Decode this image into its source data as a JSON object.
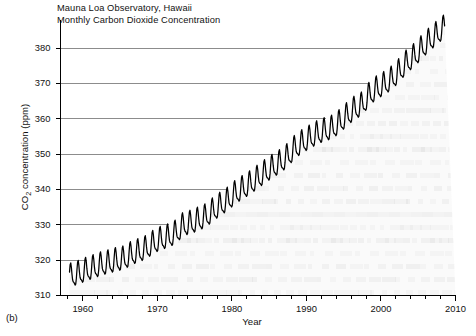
{
  "figure": {
    "panel_letter": "(b)",
    "title_line1": "Mauna Loa Observatory, Hawaii",
    "title_line2": "Monthly Carbon Dioxide Concentration",
    "xlabel": "Year",
    "ylabel_prefix": "CO",
    "ylabel_sub": "2",
    "ylabel_suffix": " concentration (ppm)"
  },
  "chart_data": {
    "type": "line",
    "title": "Mauna Loa Observatory, Hawaii Monthly Carbon Dioxide Concentration",
    "xlabel": "Year",
    "ylabel": "CO2 concentration (ppm)",
    "xlim": [
      1957,
      2010
    ],
    "ylim": [
      310,
      388
    ],
    "xticks": [
      1960,
      1970,
      1980,
      1990,
      2000,
      2010
    ],
    "xtick_labels": [
      "1960",
      "1970",
      "1980",
      "1990",
      "2000",
      "2010"
    ],
    "yticks": [
      310,
      320,
      330,
      340,
      350,
      360,
      370,
      380
    ],
    "ytick_labels": [
      "310",
      "320",
      "330",
      "340",
      "350",
      "360",
      "370",
      "380"
    ],
    "minor_xtick_interval": 2,
    "grid": "horizontal-gridlines-clipped-at-curve",
    "legend": "none",
    "line_color": "#000000",
    "gridline_color": "#808080",
    "seasonal_amplitude_ppm": 3.1,
    "seasonal_peak_month": 5,
    "seasonal_trough_month": 10,
    "series": [
      {
        "name": "Monthly mean CO2",
        "x_units": "year",
        "y_units": "ppm",
        "annual_means": {
          "1958": 315.3,
          "1959": 315.98,
          "1960": 316.91,
          "1961": 317.64,
          "1962": 318.45,
          "1963": 318.99,
          "1964": 319.62,
          "1965": 320.04,
          "1966": 321.38,
          "1967": 322.16,
          "1968": 323.04,
          "1969": 324.62,
          "1970": 325.68,
          "1971": 326.32,
          "1972": 327.45,
          "1973": 329.68,
          "1974": 330.18,
          "1975": 331.11,
          "1976": 332.04,
          "1977": 333.83,
          "1978": 335.4,
          "1979": 336.84,
          "1980": 338.75,
          "1981": 340.11,
          "1982": 341.45,
          "1983": 343.05,
          "1984": 344.65,
          "1985": 346.12,
          "1986": 347.42,
          "1987": 349.19,
          "1988": 351.57,
          "1989": 353.12,
          "1990": 354.39,
          "1991": 355.61,
          "1992": 356.45,
          "1993": 357.1,
          "1994": 358.83,
          "1995": 360.82,
          "1996": 362.61,
          "1997": 363.73,
          "1998": 366.7,
          "1999": 368.38,
          "2000": 369.55,
          "2001": 371.14,
          "2002": 373.28,
          "2003": 375.8,
          "2004": 377.52,
          "2005": 379.8,
          "2006": 381.9,
          "2007": 383.79,
          "2008": 385.6
        },
        "start_year": 1958,
        "start_month": 3,
        "end_year": 2008,
        "end_month": 7,
        "min_value_ppm": 312.8,
        "max_value_ppm": 387.8
      }
    ]
  }
}
